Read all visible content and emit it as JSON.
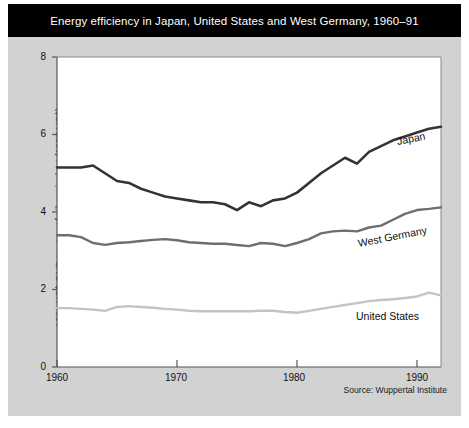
{
  "figure": {
    "title": "Energy efficiency in Japan, United States and West Germany, 1960–91",
    "source": "Source: Wuppertal Institute",
    "background_color": "#d2d2d2",
    "title_bar_color": "#000000",
    "plot_background_color": "#ffffff"
  },
  "chart_data": {
    "type": "line",
    "title": "Energy efficiency in Japan, United States and West Germany, 1960–91",
    "xlabel": "",
    "ylabel": "1000 US$ GNP per ton of oil equivalent (1987 US$)",
    "xlim": [
      1960,
      1992
    ],
    "ylim": [
      0,
      8
    ],
    "xticks": [
      1960,
      1970,
      1980,
      1990
    ],
    "yticks": [
      0,
      2,
      4,
      6,
      8
    ],
    "xtick_labels": [
      "1960",
      "1970",
      "1980",
      "1990"
    ],
    "ytick_labels": [
      "0",
      "2",
      "4",
      "6",
      "8"
    ],
    "grid": false,
    "legend": "inline-series-labels",
    "x": [
      1960,
      1961,
      1962,
      1963,
      1964,
      1965,
      1966,
      1967,
      1968,
      1969,
      1970,
      1971,
      1972,
      1973,
      1974,
      1975,
      1976,
      1977,
      1978,
      1979,
      1980,
      1981,
      1982,
      1983,
      1984,
      1985,
      1986,
      1987,
      1988,
      1989,
      1990,
      1991,
      1992
    ],
    "series": [
      {
        "name": "Japan",
        "color": "#333333",
        "width": 2.6,
        "values": [
          5.15,
          5.15,
          5.15,
          5.2,
          5.0,
          4.8,
          4.75,
          4.6,
          4.5,
          4.4,
          4.35,
          4.3,
          4.25,
          4.25,
          4.2,
          4.05,
          4.25,
          4.15,
          4.3,
          4.35,
          4.5,
          4.75,
          5.0,
          5.2,
          5.4,
          5.25,
          5.55,
          5.7,
          5.85,
          5.95,
          6.05,
          6.15,
          6.2
        ]
      },
      {
        "name": "West Germany",
        "color": "#6e6e6e",
        "width": 2.4,
        "values": [
          3.4,
          3.4,
          3.35,
          3.2,
          3.15,
          3.2,
          3.22,
          3.25,
          3.28,
          3.3,
          3.27,
          3.22,
          3.2,
          3.18,
          3.18,
          3.15,
          3.12,
          3.2,
          3.18,
          3.12,
          3.2,
          3.3,
          3.45,
          3.5,
          3.52,
          3.5,
          3.6,
          3.65,
          3.8,
          3.95,
          4.05,
          4.08,
          4.12
        ]
      },
      {
        "name": "United States",
        "color": "#c4c4c4",
        "width": 2.4,
        "values": [
          1.52,
          1.52,
          1.5,
          1.48,
          1.45,
          1.55,
          1.57,
          1.55,
          1.53,
          1.5,
          1.48,
          1.45,
          1.44,
          1.44,
          1.44,
          1.44,
          1.44,
          1.45,
          1.45,
          1.42,
          1.4,
          1.45,
          1.5,
          1.55,
          1.6,
          1.65,
          1.7,
          1.73,
          1.75,
          1.78,
          1.82,
          1.92,
          1.85
        ]
      }
    ],
    "series_label_positions": [
      {
        "name": "Japan",
        "x": 1990.2,
        "y": 5.55
      },
      {
        "name": "West Germany",
        "x": 1983.4,
        "y": 3.08
      },
      {
        "name": "United States",
        "x": 1983.2,
        "y": 1.35
      }
    ]
  }
}
